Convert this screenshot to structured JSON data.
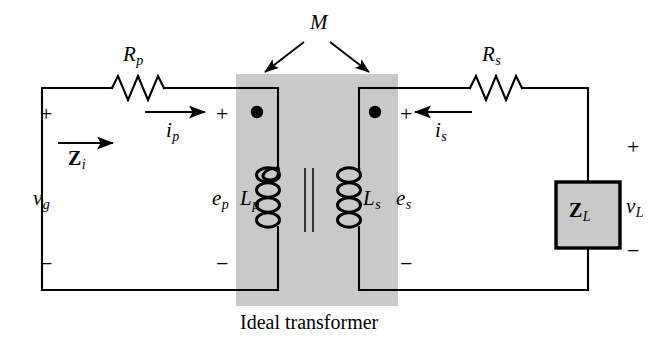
{
  "figure": {
    "caption": "Ideal transformer",
    "colors": {
      "wire": "#000000",
      "shaded_box": "#c9c9c9",
      "load_box_fill": "#c9c9c9",
      "background": "#ffffff",
      "text": "#000000"
    }
  },
  "components": {
    "resistor_primary": {
      "label": "R",
      "subscript": "p",
      "name": "primary winding resistance"
    },
    "resistor_secondary": {
      "label": "R",
      "subscript": "s",
      "name": "secondary winding resistance"
    },
    "inductor_primary": {
      "label": "L",
      "subscript": "p",
      "name": "primary magnetizing inductance"
    },
    "inductor_secondary": {
      "label": "L",
      "subscript": "s",
      "name": "secondary magnetizing inductance"
    },
    "load_impedance": {
      "label": "Z",
      "subscript": "L",
      "name": "load impedance"
    },
    "input_impedance": {
      "label": "Z",
      "subscript": "i",
      "name": "input impedance"
    },
    "mutual_inductance": {
      "label": "M",
      "name": "mutual inductance"
    }
  },
  "labels": {
    "source_voltage": {
      "symbol": "v",
      "subscript": "g"
    },
    "primary_emf": {
      "symbol": "e",
      "subscript": "p"
    },
    "secondary_emf": {
      "symbol": "e",
      "subscript": "s"
    },
    "load_voltage": {
      "symbol": "v",
      "subscript": "L"
    },
    "primary_current": {
      "symbol": "i",
      "subscript": "p"
    },
    "secondary_current": {
      "symbol": "i",
      "subscript": "s"
    }
  },
  "polarity_marks": {
    "plus": "+",
    "minus": "−",
    "positions": [
      {
        "id": "source-plus",
        "sign": "+",
        "x": 40,
        "y": 108
      },
      {
        "id": "source-minus",
        "sign": "−",
        "x": 40,
        "y": 258
      },
      {
        "id": "primary-plus",
        "sign": "+",
        "x": 216,
        "y": 108
      },
      {
        "id": "primary-minus",
        "sign": "−",
        "x": 216,
        "y": 258
      },
      {
        "id": "secondary-plus",
        "sign": "+",
        "x": 402,
        "y": 108
      },
      {
        "id": "secondary-minus",
        "sign": "−",
        "x": 402,
        "y": 258
      },
      {
        "id": "load-plus",
        "sign": "+",
        "x": 614,
        "y": 140
      },
      {
        "id": "load-minus",
        "sign": "−",
        "x": 614,
        "y": 232
      }
    ]
  },
  "dots": {
    "primary_dot": "polarity-dot",
    "secondary_dot": "polarity-dot"
  },
  "icons": {
    "resistor": "resistor-zigzag-icon",
    "inductor": "inductor-coil-icon",
    "core": "transformer-core-icon",
    "arrow": "arrow-icon",
    "dot": "dot-icon"
  }
}
